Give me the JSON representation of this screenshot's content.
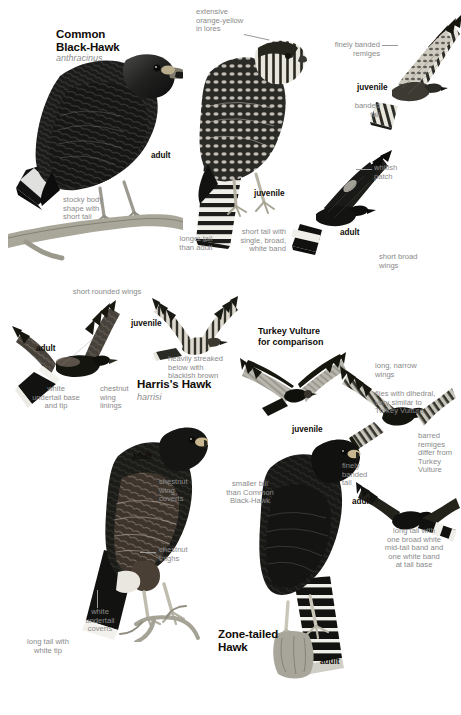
{
  "plate": {
    "width": 461,
    "height": 715,
    "background": "#ffffff",
    "text_color_heading": "#100c08",
    "text_color_note": "#8a8a8a",
    "text_color_sci": "#8e8e8e"
  },
  "species": [
    {
      "id": "common-black-hawk",
      "name": "Common\nBlack-Hawk",
      "scientific": "anthracinus"
    },
    {
      "id": "harriss-hawk",
      "name": "Harris's Hawk",
      "scientific": "harrisi"
    },
    {
      "id": "zone-tailed-hawk",
      "name": "Zone-tailed\nHawk",
      "scientific": ""
    }
  ],
  "comparison": {
    "label": "Turkey Vulture\nfor comparison"
  },
  "age_labels": {
    "cbh_perched_adult": "adult",
    "cbh_perched_juvenile": "juvenile",
    "cbh_flight_juvenile": "juvenile",
    "cbh_flight_adult": "adult",
    "hh_flight_adult": "adult",
    "hh_flight_juvenile": "juvenile",
    "hh_perched_adult": "adult",
    "zth_flight_juvenile": "juvenile",
    "zth_flight_adult_male": "adult ♂",
    "zth_perched_adult": "adult"
  },
  "notes": {
    "extensive_lores": "extensive\norange-yellow\nin lores",
    "stocky_body": "stocky body\nshape with\nshort tail",
    "longer_tail": "longer tail\nthan adult",
    "short_tail_band": "short tail with\nsingle, broad,\nwhite band",
    "finely_banded_remiges": "finely banded\nremiges",
    "banded_tail": "banded\ntail",
    "whitish_patch": "whitish\npatch",
    "short_broad_wings": "short broad\nwings",
    "short_rounded_wings": "short rounded wings",
    "white_undertail_base": "white\nundertail base\nand tip",
    "chestnut_wing_linings": "chestnut\nwing\nlinings",
    "heavily_streaked": "heavily streaked\nbelow with\nblackish brown",
    "chestnut_wing_coverts": "chestnut\nwing\ncoverts",
    "chestnut_thighs": "chestnut\nthighs",
    "white_undertail_coverts": "white\nundertail\ncoverts",
    "long_tail_white_tip": "long tail with\nwhite tip",
    "smaller_bill": "smaller bill\nthan Common\nBlack-Hawk",
    "long_narrow_wings": "long, narrow\nwings",
    "flies_dihedral": "flies with dihedral,\nvery similar to\nTurkey Vulture",
    "barred_remiges": "barred\nremiges\ndiffer from\nTurkey\nVulture",
    "finely_banded_tail": "finely\nbanded\ntail",
    "long_tail_bands": "long tail with\none broad white\nmid-tail band and\none white band\nat tail base"
  }
}
